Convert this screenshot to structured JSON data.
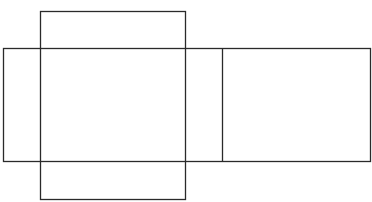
{
  "diagram": {
    "type": "cube-net",
    "stroke_color": "#2a2a2a",
    "background": "#ffffff",
    "shapes": {
      "vertical_rect": {
        "x": 40,
        "y": 11,
        "width": 145,
        "height": 188
      },
      "horizontal_band": {
        "x": 3,
        "y": 48,
        "width": 367,
        "height": 113
      },
      "divider": {
        "x": 222,
        "y1": 48,
        "y2": 161
      }
    }
  }
}
